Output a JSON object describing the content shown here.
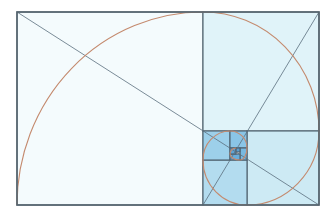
{
  "diagram": {
    "title": "",
    "type": "golden-spiral",
    "canvas": {
      "width": 335,
      "height": 213,
      "background": "#ffffff"
    },
    "colors": {
      "line": "#4d5f6c",
      "diagonal": "#5a6f7d",
      "spiral": "#c48a6e",
      "border": "#56656f"
    },
    "outer_rect": {
      "x": 17,
      "y": 12,
      "w": 302,
      "h": 193
    },
    "squares": [
      {
        "id": "s1",
        "x": 17,
        "y": 12,
        "w": 186,
        "h": 193,
        "fill": "#f4fbfd"
      },
      {
        "id": "s2",
        "x": 203,
        "y": 12,
        "w": 116,
        "h": 119,
        "fill": "#e0f3f9"
      },
      {
        "id": "s3",
        "x": 247,
        "y": 131,
        "w": 72,
        "h": 74,
        "fill": "#cdeaf4"
      },
      {
        "id": "s4",
        "x": 203,
        "y": 160,
        "w": 44,
        "h": 45,
        "fill": "#b3dcef"
      },
      {
        "id": "s5",
        "x": 203,
        "y": 131,
        "w": 27,
        "h": 29,
        "fill": "#9dd0ea"
      },
      {
        "id": "s6",
        "x": 230,
        "y": 131,
        "w": 17,
        "h": 17,
        "fill": "#8ac5e6"
      },
      {
        "id": "s7",
        "x": 240,
        "y": 148,
        "w": 7,
        "h": 12,
        "fill": "#78b9e0"
      },
      {
        "id": "s8",
        "x": 230,
        "y": 154,
        "w": 10,
        "h": 6,
        "fill": "#6aaedb"
      },
      {
        "id": "s9",
        "x": 230,
        "y": 148,
        "w": 6,
        "h": 6,
        "fill": "#5fa4d4"
      },
      {
        "id": "s10",
        "x": 236,
        "y": 148,
        "w": 4,
        "h": 4,
        "fill": "#5a9fd0"
      }
    ],
    "diagonals": [
      {
        "id": "main-diagonal",
        "x1": 17,
        "y1": 12,
        "x2": 319,
        "y2": 205
      },
      {
        "id": "cross-diagonal",
        "x1": 203,
        "y1": 205,
        "x2": 319,
        "y2": 12
      }
    ],
    "spiral_arcs": [
      {
        "id": "arc1",
        "d": "M 17 205 A 186 193 0 0 1 203 12"
      },
      {
        "id": "arc2",
        "d": "M 203 12 A 116 119 0 0 1 319 131"
      },
      {
        "id": "arc3",
        "d": "M 319 131 A 72 74 0 0 1 247 205"
      },
      {
        "id": "arc4",
        "d": "M 247 205 A 44 45 0 0 1 203 160"
      },
      {
        "id": "arc5",
        "d": "M 203 160 A 27 29 0 0 1 230 131"
      },
      {
        "id": "arc6",
        "d": "M 230 131 A 17 17 0 0 1 247 148"
      },
      {
        "id": "arc7",
        "d": "M 247 148 A 7 12 0 0 1 240 160"
      },
      {
        "id": "arc8",
        "d": "M 240 160 A 10 6 0 0 1 230 154"
      },
      {
        "id": "arc9",
        "d": "M 230 154 A 6 6 0 0 1 236 148"
      }
    ]
  }
}
